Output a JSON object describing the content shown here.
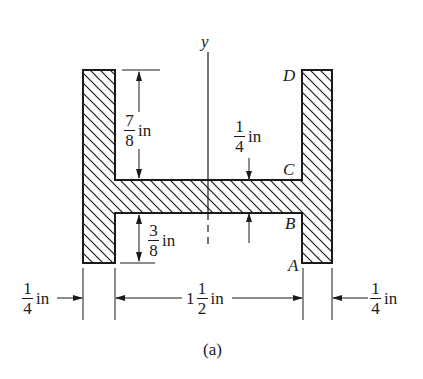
{
  "figure": {
    "caption": "(a)",
    "axis_label": "y",
    "points": {
      "A": "A",
      "B": "B",
      "C": "C",
      "D": "D"
    },
    "dimensions": {
      "flange_upper_height": {
        "num": "7",
        "den": "8",
        "unit": "in"
      },
      "flange_lower_height": {
        "num": "3",
        "den": "8",
        "unit": "in"
      },
      "web_thickness": {
        "num": "1",
        "den": "4",
        "unit": "in"
      },
      "left_flange_width": {
        "num": "1",
        "den": "4",
        "unit": "in"
      },
      "right_flange_width": {
        "num": "1",
        "den": "4",
        "unit": "in"
      },
      "inner_width": {
        "whole": "1",
        "num": "1",
        "den": "2",
        "unit": "in"
      }
    },
    "colors": {
      "line": "#1a1a1a",
      "background": "#ffffff"
    }
  }
}
